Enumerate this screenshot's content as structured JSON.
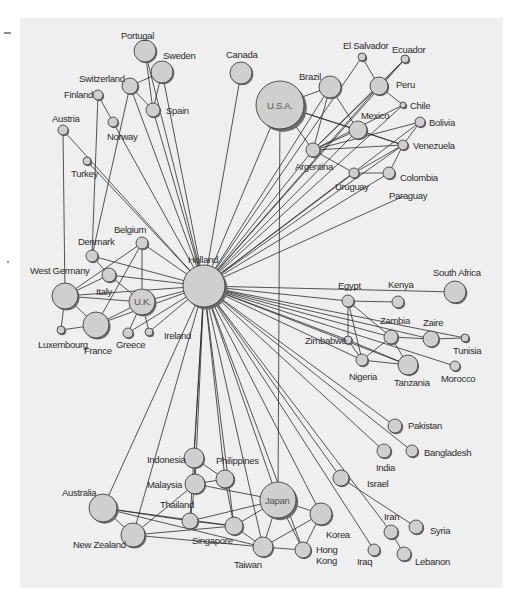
{
  "figure": {
    "panel": {
      "x": 20,
      "y": 18,
      "width": 483,
      "height": 570,
      "color": "#efefef"
    },
    "hub": "Holland",
    "nodes": [
      {
        "id": "Holland",
        "label": "Holland",
        "x": 204,
        "y": 286,
        "r": 21,
        "lx": 188,
        "ly": 263,
        "inside": false
      },
      {
        "id": "USA",
        "label": "U.S.A.",
        "x": 280,
        "y": 105,
        "r": 24,
        "lx": 267,
        "ly": 109,
        "inside": true
      },
      {
        "id": "Canada",
        "label": "Canada",
        "x": 241,
        "y": 73,
        "r": 11,
        "lx": 226,
        "ly": 58
      },
      {
        "id": "Portugal",
        "label": "Portugal",
        "x": 145,
        "y": 51,
        "r": 11,
        "lx": 121,
        "ly": 39
      },
      {
        "id": "Sweden",
        "label": "Sweden",
        "x": 162,
        "y": 72,
        "r": 11,
        "lx": 163,
        "ly": 59
      },
      {
        "id": "Switzerland",
        "label": "Switzerland",
        "x": 130,
        "y": 86,
        "r": 8,
        "lx": 79,
        "ly": 82
      },
      {
        "id": "Spain",
        "label": "Spain",
        "x": 153,
        "y": 110,
        "r": 7,
        "lx": 166,
        "ly": 114
      },
      {
        "id": "Finland",
        "label": "Finland",
        "x": 98,
        "y": 95,
        "r": 5,
        "lx": 64,
        "ly": 98
      },
      {
        "id": "Norway",
        "label": "Norway",
        "x": 113,
        "y": 122,
        "r": 5,
        "lx": 107,
        "ly": 140
      },
      {
        "id": "Austria",
        "label": "Austria",
        "x": 63,
        "y": 130,
        "r": 5,
        "lx": 52,
        "ly": 122
      },
      {
        "id": "Turkey",
        "label": "Turkey",
        "x": 87,
        "y": 161,
        "r": 4,
        "lx": 71,
        "ly": 177
      },
      {
        "id": "Brazil",
        "label": "Brazil",
        "x": 330,
        "y": 87,
        "r": 11,
        "lx": 299,
        "ly": 80
      },
      {
        "id": "ElSalvador",
        "label": "El Salvador",
        "x": 362,
        "y": 57,
        "r": 4,
        "lx": 343,
        "ly": 49
      },
      {
        "id": "Ecuador",
        "label": "Ecuador",
        "x": 405,
        "y": 59,
        "r": 4,
        "lx": 392,
        "ly": 53
      },
      {
        "id": "Peru",
        "label": "Peru",
        "x": 379,
        "y": 86,
        "r": 9,
        "lx": 396,
        "ly": 88
      },
      {
        "id": "Chile",
        "label": "Chile",
        "x": 403,
        "y": 105,
        "r": 3,
        "lx": 410,
        "ly": 109
      },
      {
        "id": "Mexico",
        "label": "Mexico",
        "x": 358,
        "y": 130,
        "r": 9,
        "lx": 361,
        "ly": 119
      },
      {
        "id": "Bolivia",
        "label": "Bolivia",
        "x": 420,
        "y": 122,
        "r": 5,
        "lx": 429,
        "ly": 126
      },
      {
        "id": "Venezuela",
        "label": "Venezuela",
        "x": 403,
        "y": 145,
        "r": 5,
        "lx": 413,
        "ly": 149
      },
      {
        "id": "Argentina",
        "label": "Argentina",
        "x": 313,
        "y": 150,
        "r": 7,
        "lx": 295,
        "ly": 170
      },
      {
        "id": "Uruguay",
        "label": "Uruguay",
        "x": 354,
        "y": 173,
        "r": 5,
        "lx": 335,
        "ly": 190
      },
      {
        "id": "Colombia",
        "label": "Colombia",
        "x": 389,
        "y": 173,
        "r": 6,
        "lx": 400,
        "ly": 181
      },
      {
        "id": "Paraguay",
        "label": "Paraguay",
        "x": 404,
        "y": 196,
        "r": 0,
        "lx": 389,
        "ly": 199
      },
      {
        "id": "Belgium",
        "label": "Belgium",
        "x": 142,
        "y": 243,
        "r": 6,
        "lx": 114,
        "ly": 233
      },
      {
        "id": "Denmark",
        "label": "Denmark",
        "x": 92,
        "y": 256,
        "r": 6,
        "lx": 78,
        "ly": 245
      },
      {
        "id": "Italy",
        "label": "Italy",
        "x": 109,
        "y": 275,
        "r": 7,
        "lx": 96,
        "ly": 295
      },
      {
        "id": "WestGermany",
        "label": "West Germany",
        "x": 65,
        "y": 296,
        "r": 13,
        "lx": 30,
        "ly": 274
      },
      {
        "id": "UK",
        "label": "U.K.",
        "x": 142,
        "y": 302,
        "r": 13,
        "lx": 134,
        "ly": 305,
        "inside": true
      },
      {
        "id": "Luxembourg",
        "label": "Luxembourg",
        "x": 61,
        "y": 330,
        "r": 4,
        "lx": 38,
        "ly": 348
      },
      {
        "id": "France",
        "label": "France",
        "x": 96,
        "y": 325,
        "r": 13,
        "lx": 84,
        "ly": 354
      },
      {
        "id": "Greece",
        "label": "Greece",
        "x": 128,
        "y": 333,
        "r": 5,
        "lx": 116,
        "ly": 348
      },
      {
        "id": "Ireland",
        "label": "Ireland",
        "x": 149,
        "y": 332,
        "r": 4,
        "lx": 164,
        "ly": 339
      },
      {
        "id": "Egypt",
        "label": "Egypt",
        "x": 348,
        "y": 301,
        "r": 6,
        "lx": 338,
        "ly": 289
      },
      {
        "id": "Kenya",
        "label": "Kenya",
        "x": 398,
        "y": 302,
        "r": 6,
        "lx": 388,
        "ly": 288
      },
      {
        "id": "SouthAfrica",
        "label": "South Africa",
        "x": 455,
        "y": 292,
        "r": 11,
        "lx": 433,
        "ly": 276
      },
      {
        "id": "Zambia",
        "label": "Zambia",
        "x": 391,
        "y": 337,
        "r": 7,
        "lx": 380,
        "ly": 324
      },
      {
        "id": "Zaire",
        "label": "Zaire",
        "x": 431,
        "y": 339,
        "r": 8,
        "lx": 423,
        "ly": 326
      },
      {
        "id": "Zimbabwe",
        "label": "Zimbabwe",
        "x": 348,
        "y": 340,
        "r": 4,
        "lx": 305,
        "ly": 344
      },
      {
        "id": "Tunisia",
        "label": "Tunisia",
        "x": 465,
        "y": 338,
        "r": 4,
        "lx": 453,
        "ly": 354
      },
      {
        "id": "Nigeria",
        "label": "Nigeria",
        "x": 362,
        "y": 360,
        "r": 6,
        "lx": 349,
        "ly": 380
      },
      {
        "id": "Tanzania",
        "label": "Tanzania",
        "x": 408,
        "y": 365,
        "r": 10,
        "lx": 394,
        "ly": 386
      },
      {
        "id": "Morocco",
        "label": "Morocco",
        "x": 455,
        "y": 366,
        "r": 5,
        "lx": 441,
        "ly": 382
      },
      {
        "id": "Pakistan",
        "label": "Pakistan",
        "x": 395,
        "y": 426,
        "r": 7,
        "lx": 408,
        "ly": 429
      },
      {
        "id": "India",
        "label": "India",
        "x": 384,
        "y": 451,
        "r": 7,
        "lx": 376,
        "ly": 471
      },
      {
        "id": "Bangladesh",
        "label": "Bangladesh",
        "x": 412,
        "y": 451,
        "r": 6,
        "lx": 424,
        "ly": 456
      },
      {
        "id": "Israel",
        "label": "Israel",
        "x": 341,
        "y": 478,
        "r": 8,
        "lx": 367,
        "ly": 487
      },
      {
        "id": "Iran",
        "label": "Iran",
        "x": 391,
        "y": 532,
        "r": 7,
        "lx": 384,
        "ly": 520
      },
      {
        "id": "Syria",
        "label": "Syria",
        "x": 416,
        "y": 527,
        "r": 7,
        "lx": 430,
        "ly": 534
      },
      {
        "id": "Iraq",
        "label": "Iraq",
        "x": 374,
        "y": 550,
        "r": 6,
        "lx": 357,
        "ly": 565
      },
      {
        "id": "Lebanon",
        "label": "Lebanon",
        "x": 404,
        "y": 554,
        "r": 7,
        "lx": 415,
        "ly": 565
      },
      {
        "id": "Japan",
        "label": "Japan",
        "x": 278,
        "y": 500,
        "r": 18,
        "lx": 265,
        "ly": 504,
        "inside": true
      },
      {
        "id": "Korea",
        "label": "Korea",
        "x": 321,
        "y": 514,
        "r": 11,
        "lx": 326,
        "ly": 538
      },
      {
        "id": "HongKong",
        "label": "Hong",
        "label2": "Kong",
        "x": 303,
        "y": 550,
        "r": 8,
        "lx": 316,
        "ly": 553
      },
      {
        "id": "Taiwan",
        "label": "Taiwan",
        "x": 263,
        "y": 547,
        "r": 10,
        "lx": 234,
        "ly": 568
      },
      {
        "id": "Philippines",
        "label": "Philippines",
        "x": 225,
        "y": 479,
        "r": 9,
        "lx": 216,
        "ly": 464
      },
      {
        "id": "Indonesia",
        "label": "Indonesia",
        "x": 194,
        "y": 458,
        "r": 10,
        "lx": 147,
        "ly": 463
      },
      {
        "id": "Malaysia",
        "label": "Malaysia",
        "x": 195,
        "y": 484,
        "r": 10,
        "lx": 147,
        "ly": 488
      },
      {
        "id": "Thailand",
        "label": "Thailand",
        "x": 190,
        "y": 521,
        "r": 8,
        "lx": 160,
        "ly": 508
      },
      {
        "id": "Singapore",
        "label": "Singapore",
        "x": 234,
        "y": 526,
        "r": 9,
        "lx": 192,
        "ly": 544
      },
      {
        "id": "Australia",
        "label": "Australia",
        "x": 103,
        "y": 508,
        "r": 14,
        "lx": 62,
        "ly": 496
      },
      {
        "id": "NewZealand",
        "label": "New Zealand",
        "x": 133,
        "y": 535,
        "r": 12,
        "lx": 73,
        "ly": 548
      }
    ],
    "edges": [
      [
        "Holland",
        "USA"
      ],
      [
        "Holland",
        "Canada"
      ],
      [
        "Holland",
        "Portugal"
      ],
      [
        "Holland",
        "Sweden"
      ],
      [
        "Holland",
        "Switzerland"
      ],
      [
        "Holland",
        "Spain"
      ],
      [
        "Holland",
        "Norway"
      ],
      [
        "Holland",
        "Austria"
      ],
      [
        "Holland",
        "Turkey"
      ],
      [
        "Holland",
        "Brazil"
      ],
      [
        "Holland",
        "ElSalvador"
      ],
      [
        "Holland",
        "Ecuador"
      ],
      [
        "Holland",
        "Peru"
      ],
      [
        "Holland",
        "Chile"
      ],
      [
        "Holland",
        "Mexico"
      ],
      [
        "Holland",
        "Bolivia"
      ],
      [
        "Holland",
        "Venezuela"
      ],
      [
        "Holland",
        "Argentina"
      ],
      [
        "Holland",
        "Uruguay"
      ],
      [
        "Holland",
        "Colombia"
      ],
      [
        "Holland",
        "Paraguay"
      ],
      [
        "Holland",
        "Belgium"
      ],
      [
        "Holland",
        "Denmark"
      ],
      [
        "Holland",
        "Italy"
      ],
      [
        "Holland",
        "WestGermany"
      ],
      [
        "Holland",
        "UK"
      ],
      [
        "Holland",
        "France"
      ],
      [
        "Holland",
        "Greece"
      ],
      [
        "Holland",
        "Ireland"
      ],
      [
        "Holland",
        "Egypt"
      ],
      [
        "Holland",
        "SouthAfrica"
      ],
      [
        "Holland",
        "Zambia"
      ],
      [
        "Holland",
        "Zaire"
      ],
      [
        "Holland",
        "Zimbabwe"
      ],
      [
        "Holland",
        "Tunisia"
      ],
      [
        "Holland",
        "Nigeria"
      ],
      [
        "Holland",
        "Tanzania"
      ],
      [
        "Holland",
        "Morocco"
      ],
      [
        "Holland",
        "Pakistan"
      ],
      [
        "Holland",
        "India"
      ],
      [
        "Holland",
        "Bangladesh"
      ],
      [
        "Holland",
        "Israel"
      ],
      [
        "Holland",
        "Iran"
      ],
      [
        "Holland",
        "Iraq"
      ],
      [
        "Holland",
        "Japan"
      ],
      [
        "Holland",
        "Korea"
      ],
      [
        "Holland",
        "HongKong"
      ],
      [
        "Holland",
        "Taiwan"
      ],
      [
        "Holland",
        "Philippines"
      ],
      [
        "Holland",
        "Indonesia"
      ],
      [
        "Holland",
        "Malaysia"
      ],
      [
        "Holland",
        "Singapore"
      ],
      [
        "Holland",
        "Australia"
      ],
      [
        "Holland",
        "NewZealand"
      ],
      [
        "Holland",
        "Thailand"
      ],
      [
        "USA",
        "Japan"
      ],
      [
        "USA",
        "Brazil"
      ],
      [
        "USA",
        "Mexico"
      ],
      [
        "USA",
        "Argentina"
      ],
      [
        "USA",
        "Venezuela"
      ],
      [
        "Portugal",
        "Spain"
      ],
      [
        "Sweden",
        "Switzerland"
      ],
      [
        "Sweden",
        "Spain"
      ],
      [
        "Switzerland",
        "Spain"
      ],
      [
        "Finland",
        "Norway"
      ],
      [
        "Finland",
        "Denmark"
      ],
      [
        "Austria",
        "WestGermany"
      ],
      [
        "Switzerland",
        "Denmark"
      ],
      [
        "Brazil",
        "Argentina"
      ],
      [
        "Brazil",
        "Mexico"
      ],
      [
        "ElSalvador",
        "Peru"
      ],
      [
        "Peru",
        "Chile"
      ],
      [
        "Peru",
        "Argentina"
      ],
      [
        "Ecuador",
        "Peru"
      ],
      [
        "Ecuador",
        "Argentina"
      ],
      [
        "Mexico",
        "Argentina"
      ],
      [
        "Mexico",
        "Venezuela"
      ],
      [
        "Argentina",
        "Venezuela"
      ],
      [
        "Argentina",
        "Uruguay"
      ],
      [
        "Argentina",
        "Chile"
      ],
      [
        "Argentina",
        "Bolivia"
      ],
      [
        "Uruguay",
        "Colombia"
      ],
      [
        "Uruguay",
        "Venezuela"
      ],
      [
        "Colombia",
        "Venezuela"
      ],
      [
        "Venezuela",
        "Bolivia"
      ],
      [
        "Belgium",
        "UK"
      ],
      [
        "Belgium",
        "WestGermany"
      ],
      [
        "Belgium",
        "France"
      ],
      [
        "Denmark",
        "Italy"
      ],
      [
        "WestGermany",
        "Italy"
      ],
      [
        "WestGermany",
        "UK"
      ],
      [
        "WestGermany",
        "France"
      ],
      [
        "WestGermany",
        "Luxembourg"
      ],
      [
        "Luxembourg",
        "France"
      ],
      [
        "France",
        "UK"
      ],
      [
        "Greece",
        "UK"
      ],
      [
        "Ireland",
        "UK"
      ],
      [
        "Italy",
        "UK"
      ],
      [
        "Egypt",
        "Kenya"
      ],
      [
        "Egypt",
        "Zimbabwe"
      ],
      [
        "Egypt",
        "Nigeria"
      ],
      [
        "Egypt",
        "Zambia"
      ],
      [
        "Zambia",
        "Zaire"
      ],
      [
        "Zambia",
        "Nigeria"
      ],
      [
        "Zambia",
        "Tanzania"
      ],
      [
        "Zaire",
        "Tunisia"
      ],
      [
        "Zimbabwe",
        "Nigeria"
      ],
      [
        "Nigeria",
        "Tanzania"
      ],
      [
        "Zimbabwe",
        "Tanzania"
      ],
      [
        "Israel",
        "Syria"
      ],
      [
        "Iran",
        "Lebanon"
      ],
      [
        "Japan",
        "Korea"
      ],
      [
        "Japan",
        "HongKong"
      ],
      [
        "Japan",
        "Taiwan"
      ],
      [
        "Japan",
        "Singapore"
      ],
      [
        "Japan",
        "Thailand"
      ],
      [
        "Japan",
        "Malaysia"
      ],
      [
        "Korea",
        "Taiwan"
      ],
      [
        "Korea",
        "HongKong"
      ],
      [
        "Taiwan",
        "HongKong"
      ],
      [
        "Taiwan",
        "Singapore"
      ],
      [
        "Indonesia",
        "Malaysia"
      ],
      [
        "Indonesia",
        "Philippines"
      ],
      [
        "Malaysia",
        "Philippines"
      ],
      [
        "Malaysia",
        "Thailand"
      ],
      [
        "Philippines",
        "Singapore"
      ],
      [
        "Thailand",
        "Singapore"
      ],
      [
        "Australia",
        "NewZealand"
      ],
      [
        "Australia",
        "Singapore"
      ],
      [
        "Australia",
        "Thailand"
      ],
      [
        "Australia",
        "Taiwan"
      ],
      [
        "NewZealand",
        "Singapore"
      ],
      [
        "NewZealand",
        "Taiwan"
      ],
      [
        "NewZealand",
        "Malaysia"
      ]
    ],
    "margin_marks": [
      {
        "x1": 4,
        "y1": 33,
        "x2": 11,
        "y2": 33
      },
      {
        "x1": 7,
        "y1": 262,
        "x2": 9,
        "y2": 262
      }
    ]
  }
}
